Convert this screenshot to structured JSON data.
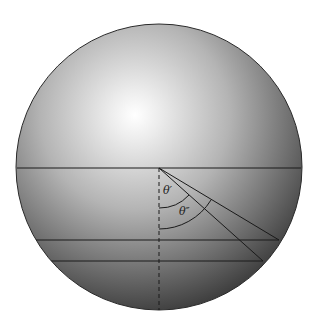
{
  "diagram": {
    "type": "sphere-refraction-angles",
    "sphere": {
      "cx": 159,
      "cy": 167,
      "r": 143,
      "highlight": {
        "cx": 135,
        "cy": 115
      }
    },
    "origin": {
      "x": 159,
      "y": 168
    },
    "horizontal_lines": [
      {
        "y": 168,
        "x1": 17,
        "x2": 301
      },
      {
        "y": 240,
        "x1": 53,
        "x2": 279
      },
      {
        "y": 261,
        "x1": 66,
        "x2": 263
      }
    ],
    "normal_line": {
      "style": "dashed",
      "x": 159,
      "y1": 168,
      "y2": 311
    },
    "rays": [
      {
        "name": "ray-theta-prime",
        "x2": 279,
        "y2": 240
      },
      {
        "name": "ray-theta-double-prime",
        "x2": 263,
        "y2": 261
      }
    ],
    "arcs": [
      {
        "name": "arc-theta-prime",
        "radius": 40
      },
      {
        "name": "arc-theta-double-prime",
        "radius": 61
      }
    ],
    "labels": {
      "theta_prime": "θ′",
      "theta_double_prime": "θ″"
    },
    "colors": {
      "line": "#1a1a1a",
      "sphere_light": "#ffffff",
      "sphere_mid": "#bdbdbd",
      "sphere_dark": "#3d3d3d",
      "outline": "#2a2a2a"
    }
  }
}
